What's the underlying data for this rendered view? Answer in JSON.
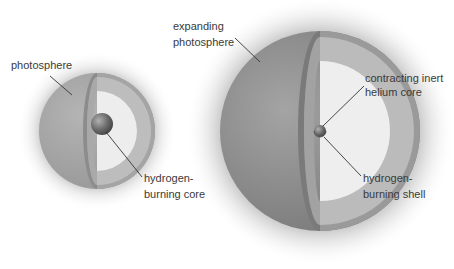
{
  "diagram": {
    "type": "star-structure-comparison",
    "stages": [
      {
        "id": "main-sequence-star",
        "labels": {
          "photosphere": "photosphere",
          "core_line1": "hydrogen-",
          "core_line2": "burning core"
        }
      },
      {
        "id": "red-giant-star",
        "labels": {
          "photosphere_line1": "expanding",
          "photosphere_line2": "photosphere",
          "core_line1": "contracting inert",
          "core_line2": "helium core",
          "shell_line1": "hydrogen-",
          "shell_line2": "burning shell"
        }
      }
    ],
    "colors": {
      "background": "#ffffff",
      "glow": "#c8c8c8",
      "outer_surface": "#a6a6a6",
      "outer_surface_large": "#8e8e8e",
      "cut_rim": "#8a8a8a",
      "envelope_band": "#bcbcbc",
      "interior": "#eeeeee",
      "core": "#6e6e6e",
      "leader_line": "#333333",
      "text": "#3a3a3a"
    }
  }
}
